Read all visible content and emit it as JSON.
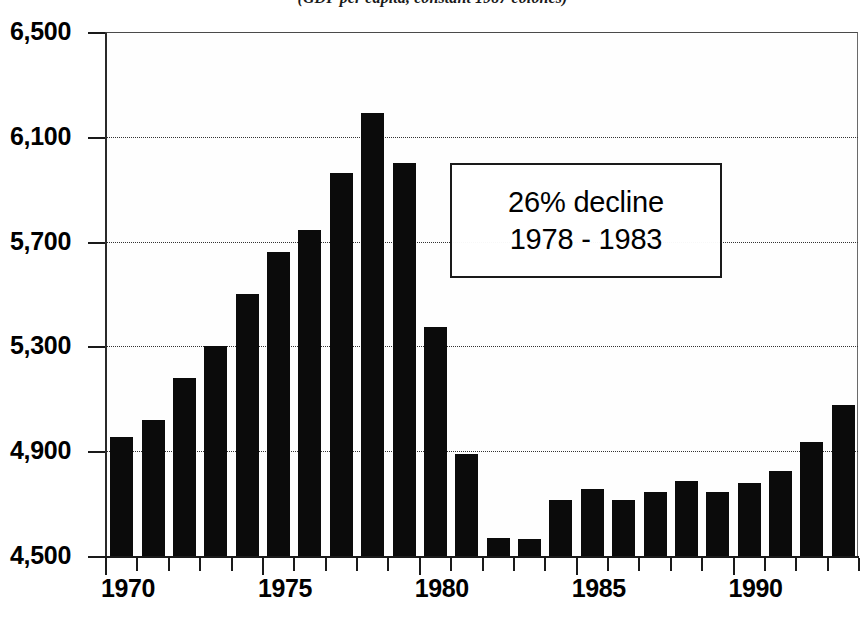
{
  "chart_data": {
    "type": "bar",
    "title": "(GDP per capita, constant 1987 colones)",
    "xlabel": "",
    "ylabel": "",
    "ylim": [
      4500,
      6500
    ],
    "ytick_values": [
      6500,
      6100,
      5700,
      5300,
      4900,
      4500
    ],
    "ytick_labels": [
      "6,500",
      "6,100",
      "5,700",
      "5,300",
      "4,900",
      "4,500"
    ],
    "xtick_labels": [
      "1970",
      "1975",
      "1980",
      "1985",
      "1990"
    ],
    "xtick_years": [
      1970,
      1975,
      1980,
      1985,
      1990
    ],
    "grid": true,
    "grid_axis": "y",
    "legend": false,
    "bar_color": "#0b0b0b",
    "categories": [
      "1970",
      "1971",
      "1972",
      "1973",
      "1974",
      "1975",
      "1976",
      "1977",
      "1978",
      "1979",
      "1980",
      "1981",
      "1982",
      "1983",
      "1984",
      "1985",
      "1986",
      "1987",
      "1988",
      "1989",
      "1990",
      "1991",
      "1992",
      "1993"
    ],
    "values": [
      4955,
      5020,
      5180,
      5300,
      5500,
      5660,
      5745,
      5960,
      6190,
      6000,
      5375,
      4890,
      4570,
      4565,
      4715,
      4755,
      4715,
      4745,
      4785,
      4745,
      4780,
      4825,
      4935,
      5075
    ],
    "annotations": [
      {
        "name": "decline-callout",
        "lines": [
          "26% decline",
          "1978 - 1983"
        ]
      }
    ]
  },
  "annotation": {
    "line1": "26% decline",
    "line2": "1978 - 1983"
  }
}
